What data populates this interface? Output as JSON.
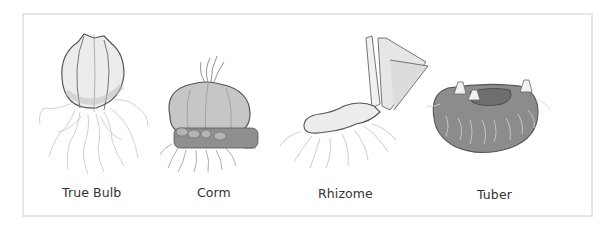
{
  "diagram": {
    "items": [
      {
        "label": "True Bulb",
        "icon": "true-bulb-illustration"
      },
      {
        "label": "Corm",
        "icon": "corm-illustration"
      },
      {
        "label": "Rhizome",
        "icon": "rhizome-illustration"
      },
      {
        "label": "Tuber",
        "icon": "tuber-illustration"
      }
    ]
  },
  "colors": {
    "frame_border": "#e6e6e6",
    "outline": "#555555",
    "bulb_fill": "#e9e9e9",
    "corm_fill": "#bdbdbd",
    "tuber_fill": "#8a8a8a",
    "root": "#b5b5b5",
    "label": "#333333"
  }
}
